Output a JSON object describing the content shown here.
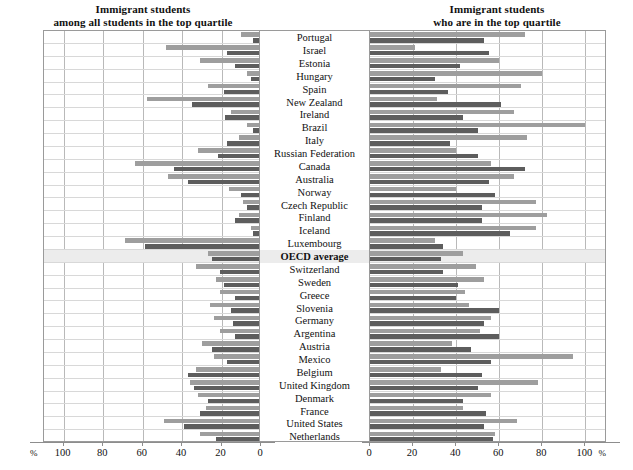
{
  "titles": {
    "left_line1": "Immigrant students",
    "left_line2": "among all students in the top quartile",
    "right_line1": "Immigrant students",
    "right_line2": "who are in the top quartile"
  },
  "axis": {
    "unit": "%",
    "left_ticks": [
      100,
      80,
      60,
      40,
      20,
      0
    ],
    "right_ticks": [
      0,
      20,
      40,
      60,
      80,
      100
    ],
    "left_range": [
      0,
      110
    ],
    "right_range": [
      0,
      110
    ]
  },
  "chart_data": {
    "type": "bar",
    "orientation": "horizontal",
    "layout": "back-to-back paired panels",
    "xlabel": "%",
    "ylabel": "",
    "xlim_left": [
      110,
      0
    ],
    "xlim_right": [
      0,
      110
    ],
    "grid": true,
    "legend_position": "none",
    "categories": [
      "Portugal",
      "Israel",
      "Estonia",
      "Hungary",
      "Spain",
      "New Zealand",
      "Ireland",
      "Brazil",
      "Italy",
      "Russian Federation",
      "Canada",
      "Australia",
      "Norway",
      "Czech Republic",
      "Finland",
      "Iceland",
      "Luxembourg",
      "OECD average",
      "Switzerland",
      "Sweden",
      "Greece",
      "Slovenia",
      "Germany",
      "Argentina",
      "Austria",
      "Mexico",
      "Belgium",
      "United Kingdom",
      "Denmark",
      "France",
      "United States",
      "Netherlands"
    ],
    "panels": [
      {
        "name": "among all students in the top quartile",
        "side": "left",
        "series": [
          {
            "name": "first-generation",
            "style": "light-gray",
            "color": "#9e9e9e",
            "values": [
              9,
              47,
              30,
              6,
              26,
              57,
              14,
              6,
              10,
              31,
              63,
              46,
              15,
              8,
              10,
              4,
              68,
              26,
              32,
              22,
              20,
              25,
              23,
              20,
              29,
              23,
              32,
              35,
              31,
              27,
              48,
              30
            ]
          },
          {
            "name": "second-generation",
            "style": "dark-gray",
            "color": "#5d5d5d",
            "values": [
              3,
              16,
              12,
              4,
              18,
              34,
              17,
              3,
              16,
              21,
              43,
              36,
              9,
              6,
              12,
              3,
              58,
              24,
              20,
              18,
              12,
              14,
              13,
              12,
              24,
              16,
              36,
              33,
              26,
              30,
              38,
              22
            ]
          }
        ]
      },
      {
        "name": "who are in the top quartile",
        "side": "right",
        "series": [
          {
            "name": "first-generation",
            "style": "light-gray",
            "color": "#9e9e9e",
            "values": [
              72,
              21,
              60,
              80,
              70,
              31,
              67,
              100,
              73,
              40,
              56,
              67,
              40,
              77,
              82,
              77,
              30,
              43,
              49,
              53,
              44,
              46,
              56,
              51,
              38,
              94,
              33,
              78,
              56,
              43,
              68,
              58
            ]
          },
          {
            "name": "second-generation",
            "style": "dark-gray",
            "color": "#5d5d5d",
            "values": [
              53,
              55,
              42,
              30,
              36,
              61,
              43,
              50,
              37,
              50,
              72,
              55,
              58,
              52,
              52,
              65,
              34,
              33,
              34,
              41,
              40,
              60,
              53,
              60,
              47,
              56,
              52,
              50,
              43,
              54,
              53,
              57
            ]
          }
        ]
      }
    ]
  }
}
